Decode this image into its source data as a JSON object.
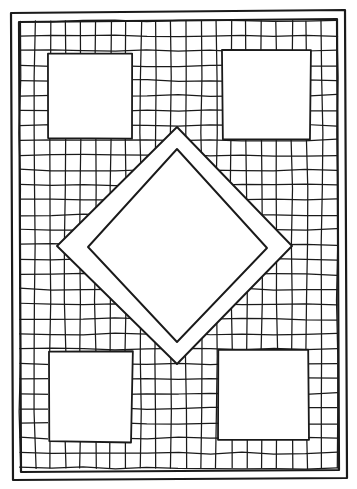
{
  "page": {
    "width": 357,
    "height": 489,
    "background_color": "#ffffff",
    "ink_color": "#1a1a1a"
  },
  "artwork": {
    "style": "hand-drawn-line-art",
    "stroke_color": "#1a1a1a",
    "fill_color": "#ffffff",
    "border": {
      "label": "Outer quilt binding",
      "outer": [
        [
          11,
          13
        ],
        [
          345,
          10
        ],
        [
          347,
          478
        ],
        [
          13,
          480
        ]
      ],
      "inner": [
        [
          19,
          22
        ],
        [
          337,
          19
        ],
        [
          339,
          470
        ],
        [
          21,
          472
        ]
      ],
      "stroke_width": 2.2
    },
    "grid": {
      "label": "Patchwork checker grid",
      "columns": 21,
      "rows": 30,
      "cell_width": 15.1,
      "cell_height": 14.9,
      "origin_x": 20,
      "origin_y": 21,
      "stroke_width": 1.25,
      "jitter": 1.1
    },
    "patches": [
      {
        "name": "corner-patch-top-left",
        "shape": "square",
        "x": 48,
        "y": 54,
        "width": 84,
        "height": 85,
        "fill": "#ffffff"
      },
      {
        "name": "corner-patch-top-right",
        "shape": "square",
        "x": 222,
        "y": 51,
        "width": 88,
        "height": 89,
        "fill": "#ffffff"
      },
      {
        "name": "corner-patch-bottom-left",
        "shape": "square",
        "x": 48,
        "y": 352,
        "width": 84,
        "height": 90,
        "fill": "#ffffff"
      },
      {
        "name": "corner-patch-bottom-right",
        "shape": "square",
        "x": 219,
        "y": 350,
        "width": 89,
        "height": 90,
        "fill": "#ffffff"
      }
    ],
    "diamond": {
      "label": "Central diamond medallion",
      "stroke_width": 1.9,
      "outer_points": [
        [
          177,
          127
        ],
        [
          292,
          246
        ],
        [
          177,
          364
        ],
        [
          57,
          246
        ]
      ],
      "inner_points": [
        [
          177,
          149
        ],
        [
          267,
          248
        ],
        [
          177,
          342
        ],
        [
          88,
          247
        ]
      ],
      "fill": "#ffffff"
    }
  }
}
